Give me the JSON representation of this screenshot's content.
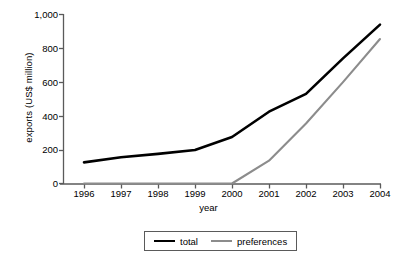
{
  "chart_data": {
    "type": "line",
    "title": "",
    "xlabel": "year",
    "ylabel": "exports (US$ million)",
    "categories": [
      "1996",
      "1997",
      "1998",
      "1999",
      "2000",
      "2001",
      "2002",
      "2003",
      "2004"
    ],
    "x": [
      1996,
      1997,
      1998,
      1999,
      2000,
      2001,
      2002,
      2003,
      2004
    ],
    "xlim": [
      1996,
      2004
    ],
    "ylim": [
      0,
      1000
    ],
    "ytick_values": [
      0,
      200,
      400,
      600,
      800,
      1000
    ],
    "ytick_labels": [
      "0",
      "200",
      "400",
      "600",
      "800",
      "1,000"
    ],
    "grid": false,
    "legend_position": "bottom-center",
    "series": [
      {
        "name": "total",
        "color": "#000000",
        "values": [
          125,
          155,
          175,
          198,
          275,
          425,
          530,
          740,
          940
        ]
      },
      {
        "name": "preferences",
        "color": "#8c8c8c",
        "values": [
          null,
          null,
          null,
          null,
          0,
          135,
          355,
          600,
          855
        ]
      }
    ]
  },
  "axes": {
    "y_title": "exports (US$ million)",
    "x_title": "year",
    "y_ticks": [
      {
        "label": "1,000"
      },
      {
        "label": "800"
      },
      {
        "label": "600"
      },
      {
        "label": "400"
      },
      {
        "label": "200"
      },
      {
        "label": "0"
      }
    ],
    "x_ticks": [
      {
        "label": "1996"
      },
      {
        "label": "1997"
      },
      {
        "label": "1998"
      },
      {
        "label": "1999"
      },
      {
        "label": "2000"
      },
      {
        "label": "2001"
      },
      {
        "label": "2002"
      },
      {
        "label": "2003"
      },
      {
        "label": "2004"
      }
    ]
  },
  "legend": {
    "items": [
      {
        "label": "total",
        "color": "#000000"
      },
      {
        "label": "preferences",
        "color": "#8c8c8c"
      }
    ]
  }
}
